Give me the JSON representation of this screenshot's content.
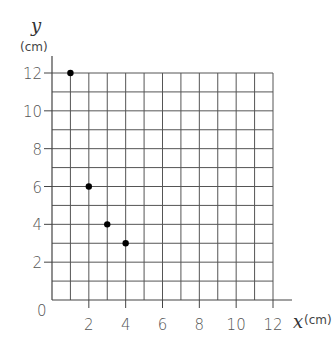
{
  "chart_data": {
    "type": "scatter",
    "title": "",
    "xlabel": "x",
    "xunit": "(cm)",
    "ylabel": "y",
    "yunit": "(cm)",
    "xlim": [
      0,
      12
    ],
    "ylim": [
      0,
      12
    ],
    "grid": true,
    "grid_step": 1,
    "x_ticks": [
      2,
      4,
      6,
      8,
      10,
      12
    ],
    "y_ticks": [
      2,
      4,
      6,
      8,
      10,
      12
    ],
    "origin_label": "0",
    "legend": null,
    "series": [
      {
        "name": "points",
        "x": [
          1,
          2,
          3,
          4
        ],
        "y": [
          12,
          6,
          4,
          3
        ]
      }
    ]
  },
  "colors": {
    "grid": "#555555",
    "axis": "#444444",
    "point": "#000000",
    "text": "#555555"
  }
}
